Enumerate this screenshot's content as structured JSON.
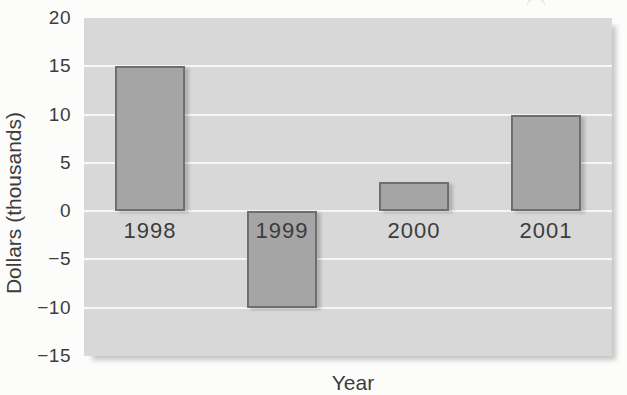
{
  "chart_data": {
    "type": "bar",
    "title": "",
    "categories": [
      "1998",
      "1999",
      "2000",
      "2001"
    ],
    "values": [
      15,
      -10,
      3,
      10
    ],
    "xlabel": "Year",
    "ylabel": "Dollars (thousands)",
    "ylim": [
      -15,
      20
    ],
    "yticks": [
      20,
      15,
      10,
      5,
      0,
      -5,
      -10,
      -15
    ],
    "grid": true,
    "legend": "none",
    "colors": {
      "plot_background": "#d8d8d8",
      "gridline": "#f6f6f4",
      "bar_fill": "#a5a5a5",
      "bar_border": "#6e6e6e",
      "text": "#3c3c3c",
      "page_background": "#fcfcfb"
    }
  }
}
